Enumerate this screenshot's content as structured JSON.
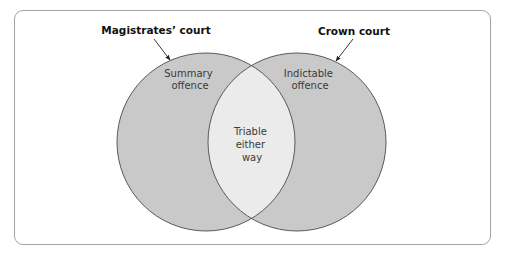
{
  "diagram": {
    "type": "venn",
    "sets": [
      {
        "id": "magistrates",
        "title": "Magistrates’ court",
        "region_label_lines": [
          "Summary",
          "offence"
        ]
      },
      {
        "id": "crown",
        "title": "Crown court",
        "region_label_lines": [
          "Indictable",
          "offence"
        ]
      }
    ],
    "intersection": {
      "label_lines": [
        "Triable",
        "either",
        "way"
      ]
    },
    "colors": {
      "circle_fill": "#c9c9c9",
      "intersection_fill": "#ebebeb",
      "stroke": "#5a5a5a",
      "frame_border": "#a3a3a3",
      "title_text": "#111111",
      "region_text": "#3a3a3a"
    }
  }
}
